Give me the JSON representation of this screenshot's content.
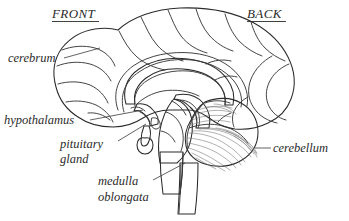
{
  "figure": {
    "background_color": "#ffffff"
  },
  "orientation_labels": [
    {
      "id": "front",
      "text": "FRONT",
      "x": 52,
      "y": 18,
      "underlined": true
    },
    {
      "id": "back",
      "text": "BACK",
      "x": 247,
      "y": 18,
      "underlined": true
    }
  ],
  "anatomy_labels": [
    {
      "id": "cerebrum",
      "lines": [
        "cerebrum"
      ],
      "x": 8,
      "y": 62,
      "anchor": "start",
      "leader": "M 64,58 L 100,48"
    },
    {
      "id": "hypothalamus",
      "lines": [
        "hypothalamus"
      ],
      "x": 4,
      "y": 124,
      "anchor": "start",
      "leader": "M 90,120 L 143,110"
    },
    {
      "id": "pituitary-gland",
      "lines": [
        "pituitary",
        "gland"
      ],
      "x": 60,
      "y": 148,
      "anchor": "start",
      "leader": "M 118,141 L 146,124"
    },
    {
      "id": "medulla-oblongata",
      "lines": [
        "medulla",
        "oblongata"
      ],
      "x": 98,
      "y": 185,
      "anchor": "start",
      "leader": "M 153,180 L 185,163"
    },
    {
      "id": "cerebellum",
      "lines": [
        "cerebellum"
      ],
      "x": 273,
      "y": 152,
      "anchor": "start",
      "leader": "M 255,148 L 271,148"
    }
  ],
  "regions": [
    {
      "id": "cerebrum-cortex",
      "name": "cerebrum",
      "fill": "#d6d6d4"
    },
    {
      "id": "corpus-callosum",
      "name": "corpus callosum",
      "fill": "#c6c6c4"
    },
    {
      "id": "thalamus",
      "name": "thalamus",
      "fill": "#b9b9b7"
    },
    {
      "id": "brainstem",
      "name": "brainstem / pons",
      "fill": "#b0b0ae"
    },
    {
      "id": "medulla",
      "name": "medulla oblongata",
      "fill": "#9d9d9b"
    },
    {
      "id": "spinal-cord",
      "name": "spinal cord",
      "fill": "#b0b0ae"
    },
    {
      "id": "cerebellum-body",
      "name": "cerebellum",
      "fill": "#e3e3e1"
    },
    {
      "id": "pituitary",
      "name": "pituitary gland",
      "fill": "#c2c2c0"
    },
    {
      "id": "hypothalamus-region",
      "name": "hypothalamus",
      "fill": "#c9c9c7"
    }
  ],
  "colors": {
    "outline": "#2a2a2a",
    "sulci": "#3a3a3a",
    "folia": "#6f6f6f",
    "text": "#2b2b2b",
    "leader": "#3a3a3a"
  }
}
